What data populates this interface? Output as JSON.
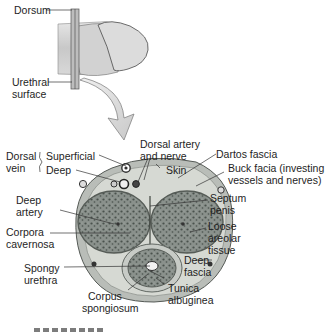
{
  "diagram": {
    "type": "anatomical-cross-section",
    "orientation_labels": {
      "dorsum": "Dorsum",
      "urethral_surface": [
        "Urethral",
        "surface"
      ]
    },
    "labels": {
      "dorsal_vein": [
        "Dorsal",
        "vein"
      ],
      "superficial": "Superficial",
      "deep": "Deep",
      "dorsal_artery_nerve": [
        "Dorsal artery",
        "and nerve"
      ],
      "skin": "Skin",
      "dartos_fascia": "Dartos fascia",
      "buck_fascia": [
        "Buck facia (investing",
        "vessels and nerves)"
      ],
      "septum_penis": [
        "Septum",
        "penis"
      ],
      "deep_artery": [
        "Deep",
        "artery"
      ],
      "loose_areolar": [
        "Loose",
        "areolar",
        "tissue"
      ],
      "corpora_cavernosa": [
        "Corpora",
        "cavernosa"
      ],
      "deep_fascia": [
        "Deep",
        "fascia"
      ],
      "spongy_urethra": [
        "Spongy",
        "urethra"
      ],
      "tunica_albuginea": [
        "Tunica",
        "albuginea"
      ],
      "corpus_spongiosum": [
        "Corpus",
        "spongiosum"
      ]
    },
    "colors": {
      "skin_outer": "#b9bdb8",
      "fascia_layer": "#d6d9d3",
      "erectile_tissue": "#7d8580",
      "erectile_dark": "#4f5752",
      "outline": "#555a56",
      "arrow_fill": "#d4d4d4",
      "leader_line": "#333333"
    }
  }
}
